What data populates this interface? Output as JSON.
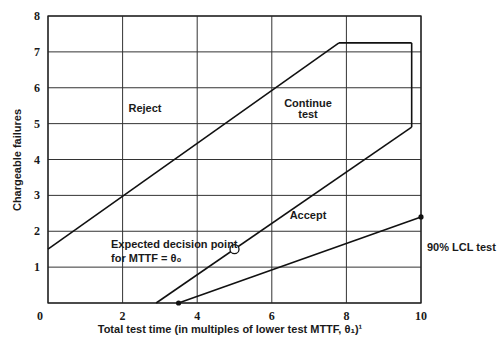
{
  "chart_data": {
    "type": "line",
    "title": "",
    "xlabel": "Total test time (in multiples of lower test MTTF, θ₁)¹",
    "ylabel": "Chargeable failures",
    "xlim": [
      0,
      10
    ],
    "ylim": [
      0,
      8
    ],
    "x_ticks": [
      "0",
      "2",
      "4",
      "6",
      "8",
      "10"
    ],
    "y_ticks": [
      "0",
      "1",
      "2",
      "3",
      "4",
      "5",
      "6",
      "7",
      "8"
    ],
    "grid": true,
    "series": [
      {
        "name": "Reject boundary",
        "x": [
          0,
          7.8
        ],
        "y": [
          1.5,
          7.25
        ]
      },
      {
        "name": "Truncation (top)",
        "x": [
          7.8,
          9.75
        ],
        "y": [
          7.25,
          7.25
        ]
      },
      {
        "name": "Truncation (right)",
        "x": [
          9.75,
          9.75
        ],
        "y": [
          7.25,
          4.9
        ]
      },
      {
        "name": "Accept boundary",
        "x": [
          2.9,
          9.75
        ],
        "y": [
          0,
          4.9
        ]
      },
      {
        "name": "90% LCL test",
        "x": [
          3.5,
          10
        ],
        "y": [
          0,
          2.4
        ]
      }
    ],
    "points": [
      {
        "name": "Expected decision point",
        "x": 5.0,
        "y": 1.5,
        "marker": "open-circle"
      },
      {
        "name": "LCL start",
        "x": 3.5,
        "y": 0,
        "marker": "filled-dot"
      },
      {
        "name": "LCL end",
        "x": 10,
        "y": 2.4,
        "marker": "filled-dot"
      }
    ],
    "annotations": {
      "reject": "Reject",
      "continue_1": "Continue",
      "continue_2": "test",
      "accept": "Accept",
      "decision_1": "Expected decision point",
      "decision_2": "for MTTF = θ₀",
      "lcl": "90% LCL test"
    }
  }
}
